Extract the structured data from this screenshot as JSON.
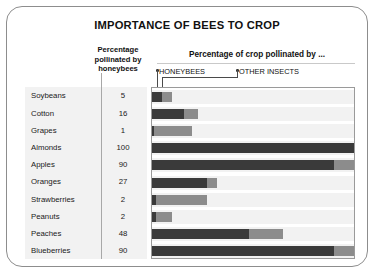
{
  "title": "IMPORTANCE OF BEES TO CROP",
  "header": {
    "left_col_line1": "Percentage",
    "left_col_line2": "pollinated by",
    "left_col_line3": "honeybees",
    "right_col": "Percentage of crop pollinated by ..."
  },
  "legend": {
    "honeybees": "HONEYBEES",
    "other_insects": "OTHER  INSECTS"
  },
  "chart_data": {
    "type": "bar",
    "title": "IMPORTANCE OF BEES TO CROP",
    "xlabel": "Percentage of crop pollinated by ...",
    "ylabel": "",
    "xlim": [
      0,
      100
    ],
    "grid": false,
    "legend_position": "top",
    "orientation": "horizontal",
    "stacked": true,
    "categories": [
      "Soybeans",
      "Cotton",
      "Grapes",
      "Almonds",
      "Apples",
      "Oranges",
      "Strawberries",
      "Peanuts",
      "Peaches",
      "Blueberries"
    ],
    "value_column_label": "Percentage pollinated by honeybees",
    "values": [
      5,
      16,
      1,
      100,
      90,
      27,
      2,
      2,
      48,
      90
    ],
    "series": [
      {
        "name": "HONEYBEES",
        "color": "#3a3a3a",
        "values": [
          5,
          16,
          1,
          100,
          90,
          27,
          2,
          2,
          48,
          90
        ]
      },
      {
        "name": "OTHER  INSECTS",
        "color": "#8c8c8c",
        "values": [
          5,
          7,
          19,
          0,
          10,
          5,
          25,
          8,
          17,
          10
        ]
      }
    ]
  },
  "rows": [
    {
      "crop": "Soybeans",
      "pct": "5",
      "hb": 5,
      "oi": 5
    },
    {
      "crop": "Cotton",
      "pct": "16",
      "hb": 16,
      "oi": 7
    },
    {
      "crop": "Grapes",
      "pct": "1",
      "hb": 1,
      "oi": 19
    },
    {
      "crop": "Almonds",
      "pct": "100",
      "hb": 100,
      "oi": 0
    },
    {
      "crop": "Apples",
      "pct": "90",
      "hb": 90,
      "oi": 10
    },
    {
      "crop": "Oranges",
      "pct": "27",
      "hb": 27,
      "oi": 5
    },
    {
      "crop": "Strawberries",
      "pct": "2",
      "hb": 2,
      "oi": 25
    },
    {
      "crop": "Peanuts",
      "pct": "2",
      "hb": 2,
      "oi": 8
    },
    {
      "crop": "Peaches",
      "pct": "48",
      "hb": 48,
      "oi": 17
    },
    {
      "crop": "Blueberries",
      "pct": "90",
      "hb": 90,
      "oi": 10
    }
  ],
  "colors": {
    "honeybee": "#3a3a3a",
    "other": "#8c8c8c",
    "stripe": "#f2f2f2"
  }
}
